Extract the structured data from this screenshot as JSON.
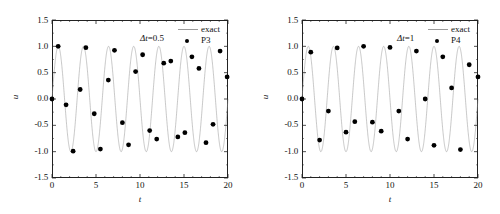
{
  "figure": {
    "background": "#ffffff",
    "line_color": "#9a9a9a",
    "marker_color": "#000000",
    "axis_color": "#222222"
  },
  "panels": [
    {
      "id": "panel-left",
      "annotation_prefix": "Δt",
      "annotation_eq": "=0.5",
      "annotation_full": "Δt=0.5",
      "xlabel": "t",
      "ylabel": "u",
      "xticks": [
        "0",
        "5",
        "10",
        "15",
        "20"
      ],
      "yticks": [
        "1.5",
        "1.0",
        "0.5",
        "0.0",
        "-0.5",
        "-1.0",
        "-1.5"
      ],
      "legend": [
        {
          "label": "exact",
          "type": "line"
        },
        {
          "label": "P3",
          "type": "marker"
        }
      ]
    },
    {
      "id": "panel-right",
      "annotation_prefix": "Δt",
      "annotation_eq": "=1",
      "annotation_full": "Δt=1",
      "xlabel": "t",
      "ylabel": "u",
      "xticks": [
        "0",
        "5",
        "10",
        "15",
        "20"
      ],
      "yticks": [
        "1.5",
        "1.0",
        "0.5",
        "0.0",
        "-0.5",
        "-1.0",
        "-1.5"
      ],
      "legend": [
        {
          "label": "exact",
          "type": "line"
        },
        {
          "label": "P4",
          "type": "marker"
        }
      ]
    }
  ],
  "chart_data": [
    {
      "type": "line",
      "title": "",
      "subtitle": "Δt=0.5",
      "xlabel": "t",
      "ylabel": "u",
      "xlim": [
        0,
        20
      ],
      "ylim": [
        -1.5,
        1.5
      ],
      "xticks": [
        0,
        5,
        10,
        15,
        20
      ],
      "yticks": [
        -1.5,
        -1.0,
        -0.5,
        0.0,
        0.5,
        1.0,
        1.5
      ],
      "grid": false,
      "legend_position": "top-right",
      "series": [
        {
          "name": "exact",
          "type": "line",
          "color": "#9a9a9a",
          "formula": "u = sin(2*pi*t/2.857)",
          "period": 2.857,
          "amplitude": 1.0,
          "n_periods": 7
        },
        {
          "name": "P3",
          "type": "scatter",
          "color": "#000000",
          "marker": "filled-circle",
          "x": [
            0.0,
            0.7,
            1.6,
            2.4,
            3.2,
            3.85,
            4.8,
            5.5,
            6.4,
            7.1,
            8.0,
            8.7,
            9.5,
            10.3,
            11.1,
            11.9,
            12.7,
            13.5,
            14.3,
            15.1,
            15.9,
            16.7,
            17.5,
            18.3,
            19.1,
            19.9
          ],
          "y": [
            0.0,
            1.0,
            -0.11,
            -0.99,
            0.18,
            0.975,
            -0.28,
            -0.95,
            0.36,
            0.925,
            -0.45,
            -0.87,
            0.52,
            0.84,
            -0.6,
            -0.76,
            0.68,
            0.72,
            -0.72,
            -0.64,
            0.8,
            0.58,
            -0.83,
            -0.48,
            0.91,
            0.42
          ]
        }
      ]
    },
    {
      "type": "line",
      "title": "",
      "subtitle": "Δt=1",
      "xlabel": "t",
      "ylabel": "u",
      "xlim": [
        0,
        20
      ],
      "ylim": [
        -1.5,
        1.5
      ],
      "xticks": [
        0,
        5,
        10,
        15,
        20
      ],
      "yticks": [
        -1.5,
        -1.0,
        -0.5,
        0.0,
        0.5,
        1.0,
        1.5
      ],
      "grid": false,
      "legend_position": "top-right",
      "series": [
        {
          "name": "exact",
          "type": "line",
          "color": "#9a9a9a",
          "formula": "u = sin(2*pi*t/2.857)",
          "period": 2.857,
          "amplitude": 1.0,
          "n_periods": 7
        },
        {
          "name": "P4",
          "type": "scatter",
          "color": "#000000",
          "marker": "filled-circle",
          "x": [
            0,
            1,
            2,
            3,
            4,
            5,
            6,
            7,
            8,
            9,
            10,
            11,
            12,
            13,
            14,
            15,
            16,
            17,
            18,
            19,
            20
          ],
          "y": [
            0.0,
            0.89,
            -0.78,
            -0.23,
            0.97,
            -0.63,
            -0.43,
            1.0,
            -0.44,
            -0.61,
            0.98,
            -0.23,
            -0.76,
            0.91,
            0.0,
            -0.88,
            0.8,
            0.21,
            -0.96,
            0.65,
            0.42
          ]
        }
      ]
    }
  ]
}
